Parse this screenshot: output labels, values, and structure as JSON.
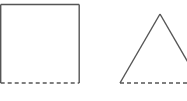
{
  "diagram": {
    "stroke_color": "#555555",
    "stroke_width": 1.4,
    "dash_pattern": "4 3",
    "shapes": [
      {
        "type": "square",
        "name": "square",
        "x": 0.7,
        "y": 4.5,
        "width": 78.5,
        "height": 78.5,
        "dashed_edge": "bottom"
      },
      {
        "type": "triangle",
        "name": "triangle",
        "apex": [
          160,
          14
        ],
        "base_left": [
          120,
          83
        ],
        "base_right": [
          200,
          83
        ],
        "dashed_edge": "base"
      }
    ]
  }
}
